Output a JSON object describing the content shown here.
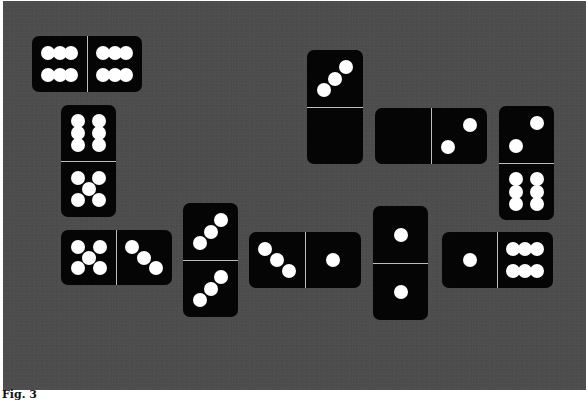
{
  "figure": {
    "caption": "Fig. 3",
    "background_color": "#4d4d4d",
    "domino_color": "#050505",
    "pip_color": "#ffffff"
  },
  "dominoes": [
    {
      "id": "d1",
      "orientation": "horizontal",
      "x": 32,
      "y": 36,
      "w": 110,
      "h": 56,
      "a": 6,
      "b": 6
    },
    {
      "id": "d2",
      "orientation": "vertical",
      "x": 61,
      "y": 105,
      "w": 55,
      "h": 112,
      "a": 6,
      "b": 5
    },
    {
      "id": "d3",
      "orientation": "horizontal",
      "x": 61,
      "y": 230,
      "w": 111,
      "h": 55,
      "a": 5,
      "b": 3
    },
    {
      "id": "d4",
      "orientation": "vertical",
      "x": 183,
      "y": 203,
      "w": 55,
      "h": 114,
      "a": 3,
      "b": 3
    },
    {
      "id": "d5",
      "orientation": "horizontal",
      "x": 249,
      "y": 232,
      "w": 112,
      "h": 56,
      "a": 3,
      "b": 1
    },
    {
      "id": "d6",
      "orientation": "vertical",
      "x": 307,
      "y": 50,
      "w": 56,
      "h": 114,
      "a": 3,
      "b": 0
    },
    {
      "id": "d7",
      "orientation": "horizontal",
      "x": 375,
      "y": 108,
      "w": 112,
      "h": 56,
      "a": 0,
      "b": 2
    },
    {
      "id": "d8",
      "orientation": "vertical",
      "x": 373,
      "y": 206,
      "w": 55,
      "h": 114,
      "a": 1,
      "b": 1
    },
    {
      "id": "d9",
      "orientation": "vertical",
      "x": 499,
      "y": 106,
      "w": 55,
      "h": 114,
      "a": 2,
      "b": 6
    },
    {
      "id": "d10",
      "orientation": "horizontal",
      "x": 442,
      "y": 232,
      "w": 111,
      "h": 56,
      "a": 1,
      "b": 6
    }
  ]
}
